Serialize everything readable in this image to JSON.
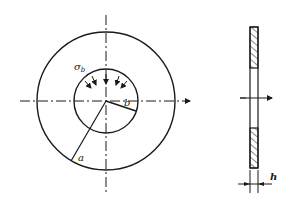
{
  "diagram": {
    "type": "technical-drawing",
    "colors": {
      "line": "#1a1a1a",
      "background": "#ffffff"
    },
    "front_view": {
      "labels": {
        "pressure": "σb",
        "pressure_symbol": "σ",
        "pressure_subscript": "b",
        "inner_radius": "b",
        "outer_radius": "a"
      }
    },
    "side_view": {
      "labels": {
        "thickness": "h"
      }
    }
  }
}
